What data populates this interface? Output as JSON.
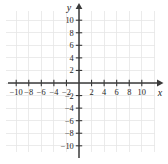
{
  "chart_data": {
    "type": "scatter",
    "title": "",
    "subtitle": "",
    "xlabel": "x",
    "ylabel": "y",
    "xlim": [
      -11.5,
      11.5
    ],
    "ylim": [
      -11.5,
      11.5
    ],
    "grid": true,
    "grid_step": 2,
    "tick_step": 2,
    "legend": "none",
    "series": [],
    "annotations": [],
    "x_tick_labels": [
      "-10",
      "-8",
      "-6",
      "-4",
      "-2",
      "2",
      "4",
      "6",
      "8",
      "10"
    ],
    "x_tick_values": [
      -10,
      -8,
      -6,
      -4,
      -2,
      2,
      4,
      6,
      8,
      10
    ],
    "y_tick_labels": [
      "10",
      "8",
      "6",
      "4",
      "2",
      "-2",
      "-4",
      "-6",
      "-8",
      "-10"
    ],
    "y_tick_values": [
      10,
      8,
      6,
      4,
      2,
      -2,
      -4,
      -6,
      -8,
      -10
    ],
    "origin_label": "",
    "colors": {
      "grid": "#e6e6e6",
      "axis": "#3a3a3a",
      "label": "#262626",
      "background": "#ffffff"
    }
  },
  "axes": {
    "x_name": "x",
    "y_name": "y"
  },
  "ticks": {
    "x": [
      {
        "value": -10,
        "label": "-10"
      },
      {
        "value": -8,
        "label": "-8"
      },
      {
        "value": -6,
        "label": "-6"
      },
      {
        "value": -4,
        "label": "-4"
      },
      {
        "value": -2,
        "label": "-2"
      },
      {
        "value": 2,
        "label": "2"
      },
      {
        "value": 4,
        "label": "4"
      },
      {
        "value": 6,
        "label": "6"
      },
      {
        "value": 8,
        "label": "8"
      },
      {
        "value": 10,
        "label": "10"
      }
    ],
    "y": [
      {
        "value": 10,
        "label": "10"
      },
      {
        "value": 8,
        "label": "8"
      },
      {
        "value": 6,
        "label": "6"
      },
      {
        "value": 4,
        "label": "4"
      },
      {
        "value": 2,
        "label": "2"
      },
      {
        "value": -2,
        "label": "-2"
      },
      {
        "value": -4,
        "label": "-4"
      },
      {
        "value": -6,
        "label": "-6"
      },
      {
        "value": -8,
        "label": "-8"
      },
      {
        "value": -10,
        "label": "-10"
      }
    ]
  }
}
